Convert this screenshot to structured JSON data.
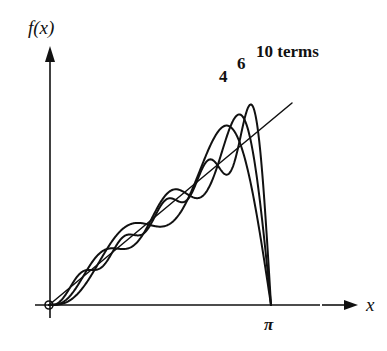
{
  "chart_data": {
    "type": "line",
    "title": "",
    "function": "f(x) = x",
    "xlabel": "x",
    "ylabel": "f(x)",
    "xlim": [
      0,
      3.4
    ],
    "x_ticks": [
      {
        "value": 3.14159,
        "label": "π"
      }
    ],
    "grid": false,
    "legend": "inline labels near peaks",
    "series": [
      {
        "name": "f(x) = x",
        "terms": null,
        "label": ""
      },
      {
        "name": "4 terms",
        "terms": 4,
        "label": "4"
      },
      {
        "name": "6 terms",
        "terms": 6,
        "label": "6"
      },
      {
        "name": "10 terms",
        "terms": 10,
        "label": "10 terms"
      }
    ],
    "annotations": [
      "4",
      "6",
      "10 terms"
    ]
  },
  "axes": {
    "x_label": "x",
    "y_label": "f(x)",
    "pi_label": "π"
  },
  "labels": {
    "four": "4",
    "six": "6",
    "ten": "10 terms"
  },
  "colors": {
    "ink": "#111111",
    "background": "#ffffff"
  }
}
